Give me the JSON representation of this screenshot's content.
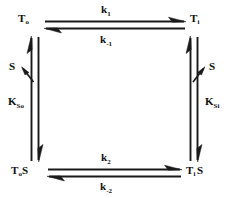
{
  "diagram": {
    "type": "kinetic-cycle",
    "background_color": "#ffffff",
    "stroke_color": "#1a1a1a",
    "text_color": "#101010",
    "nodes": [
      {
        "id": "node-top-left",
        "base": "T",
        "subscript": "o",
        "suffix": "",
        "full_text": "To",
        "position": "top-left"
      },
      {
        "id": "node-top-right",
        "base": "T",
        "subscript": "i",
        "suffix": "",
        "full_text": "Ti",
        "position": "top-right"
      },
      {
        "id": "node-bottom-left",
        "base": "T",
        "subscript": "o",
        "suffix": "S",
        "full_text": "ToS",
        "position": "bottom-left"
      },
      {
        "id": "node-bottom-right",
        "base": "T",
        "subscript": "i",
        "suffix": "S",
        "full_text": "TiS",
        "position": "bottom-right"
      }
    ],
    "rates": [
      {
        "id": "rate-top-forward",
        "base": "k",
        "subscript": "1",
        "full_text": "k1",
        "edge": "top",
        "direction": "right"
      },
      {
        "id": "rate-top-reverse",
        "base": "k",
        "subscript": "-1",
        "full_text": "k-1",
        "edge": "top",
        "direction": "left"
      },
      {
        "id": "rate-bottom-forward",
        "base": "k",
        "subscript": "2",
        "full_text": "k2",
        "edge": "bottom",
        "direction": "right"
      },
      {
        "id": "rate-bottom-reverse",
        "base": "k",
        "subscript": "-2",
        "full_text": "k-2",
        "edge": "bottom",
        "direction": "left"
      }
    ],
    "constants": [
      {
        "id": "constant-left",
        "base": "K",
        "subscript": "So",
        "full_text": "KSo",
        "edge": "left"
      },
      {
        "id": "constant-right",
        "base": "K",
        "subscript": "Si",
        "full_text": "KSi",
        "edge": "right"
      }
    ],
    "species": [
      {
        "id": "species-left",
        "label": "S",
        "edge": "left"
      },
      {
        "id": "species-right",
        "label": "S",
        "edge": "right"
      }
    ]
  }
}
